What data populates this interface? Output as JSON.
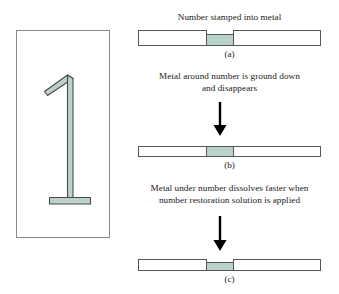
{
  "colors": {
    "metal_fill": "#b9d2cc",
    "outline": "#4a4a4a",
    "panel_border": "#8a8a8a",
    "bar_outline": "#555555",
    "arrow": "#000000",
    "background": "#ffffff",
    "text": "#1a1a1a"
  },
  "illustration_panel": {
    "name": "stamped-number-one",
    "description": "Outlined numeral 1 with diagonal flag, vertical stem and horizontal base"
  },
  "steps": [
    {
      "id": "a",
      "caption": "Number stamped into metal",
      "caption_lines": [
        "Number stamped into metal"
      ],
      "label": "(a)",
      "bar_state": "notch-raised-shoulders",
      "has_arrow_before": false
    },
    {
      "id": "b",
      "caption": "Metal around number is ground down and disappears",
      "caption_lines": [
        "Metal around number is ground down",
        "and disappears"
      ],
      "label": "(b)",
      "bar_state": "flat-uniform",
      "has_arrow_before": true
    },
    {
      "id": "c",
      "caption": "Metal under number dissolves faster when number restoration solution is applied",
      "caption_lines": [
        "Metal under number dissolves faster when",
        "number restoration solution is applied"
      ],
      "label": "(c)",
      "bar_state": "notch-recessed",
      "has_arrow_before": true
    }
  ]
}
